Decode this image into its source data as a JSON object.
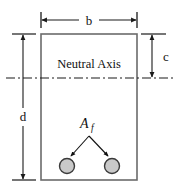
{
  "figure": {
    "labels": {
      "width_dimension": "b",
      "depth_dimension": "d",
      "neutral_axis_depth_dimension": "c",
      "neutral_axis_text": "Neutral Axis",
      "reinforcement_area_symbol": "A",
      "reinforcement_area_subscript": "f"
    },
    "colors": {
      "outline": "#6b6b6b",
      "dimension_line": "#1a1a1a",
      "centerline": "#1a1a1a",
      "bar_fill": "#c9c9c9",
      "bar_stroke": "#3a3a3a",
      "text": "#111111",
      "background": "#ffffff"
    },
    "geometry": {
      "section_left": 41,
      "section_right": 137,
      "section_top": 34,
      "section_bottom": 180,
      "neutral_axis_y": 78,
      "bars": [
        {
          "cx": 67,
          "cy": 166,
          "r": 7.5
        },
        {
          "cx": 112,
          "cy": 166,
          "r": 7.5
        }
      ],
      "leader_apex": {
        "x": 89,
        "y": 136
      },
      "b_dimension_y": 20,
      "c_dimension_x": 152,
      "d_dimension_x": 23
    }
  }
}
